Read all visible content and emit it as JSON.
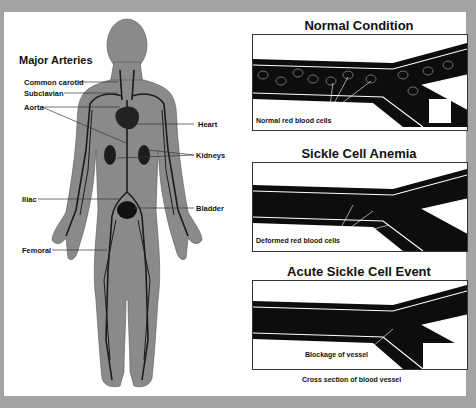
{
  "body_diagram": {
    "title": "Major Arteries",
    "labels": {
      "common_carotid": "Common carotid",
      "subclavian": "Subclavian",
      "aorta": "Aorta",
      "heart": "Heart",
      "kidneys": "Kidneys",
      "iliac": "Iliac",
      "bladder": "Bladder",
      "femoral": "Femoral"
    }
  },
  "vessel_panels": [
    {
      "title": "Normal Condition",
      "caption": "Normal red blood cells"
    },
    {
      "title": "Sickle Cell Anemia",
      "caption": "Deformed red blood cells"
    },
    {
      "title": "Acute Sickle Cell Event",
      "caption": "Blockage of vessel"
    }
  ],
  "footer_caption": "Cross section of blood vessel",
  "colors": {
    "frame": "#a3a3a3",
    "body": "#8a8a8a",
    "vessel": "#0d0d0d",
    "artery": "#1a1a1a"
  }
}
